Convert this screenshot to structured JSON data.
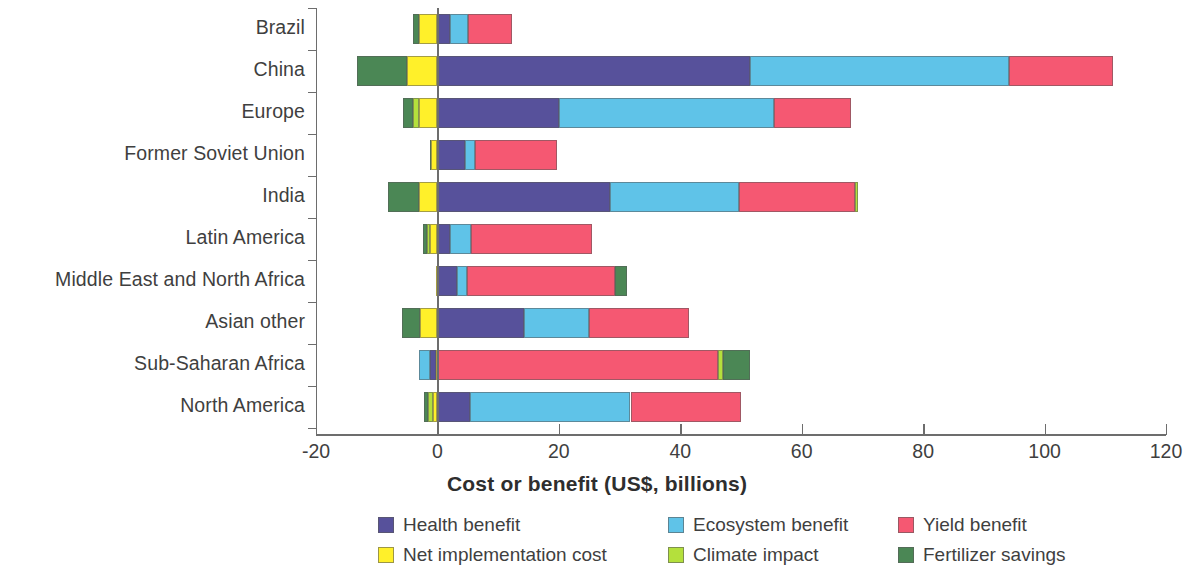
{
  "chart_data": {
    "type": "bar",
    "orientation": "horizontal",
    "stacked": true,
    "title": "",
    "xlabel": "Cost or benefit (US$, billions)",
    "ylabel": "",
    "xlim": [
      -20,
      120
    ],
    "xticks": [
      -20,
      0,
      20,
      40,
      60,
      80,
      100,
      120
    ],
    "xticklabels": [
      "-20",
      "0",
      "20",
      "40",
      "60",
      "80",
      "100",
      "120"
    ],
    "grid": false,
    "legend_position": "below",
    "categories": [
      "Brazil",
      "China",
      "Europe",
      "Former Soviet Union",
      "India",
      "Latin America",
      "Middle East and North Africa",
      "Asian other",
      "Sub-Saharan Africa",
      "North America"
    ],
    "series": [
      {
        "name": "Health benefit",
        "color": "#57519b",
        "values": [
          2.0,
          51.5,
          20.0,
          4.5,
          28.5,
          2.0,
          3.2,
          14.3,
          1.2,
          5.3
        ]
      },
      {
        "name": "Ecosystem benefit",
        "color": "#5fc3e8",
        "values": [
          3.0,
          42.7,
          35.5,
          1.7,
          21.2,
          3.6,
          1.7,
          10.7,
          -1.2,
          26.5
        ]
      },
      {
        "name": "Yield benefit",
        "color": "#f55872",
        "values": [
          7.3,
          17.0,
          12.7,
          13.5,
          19.0,
          19.8,
          24.3,
          16.5,
          46.2,
          18.2
        ]
      },
      {
        "name": "Net implementation cost",
        "color": "#fff02a",
        "values": [
          -3.1,
          -5.0,
          -3.1,
          -1.0,
          -3.1,
          -1.2,
          -0.3,
          -2.8,
          -0.3,
          -0.7
        ]
      },
      {
        "name": "Climate impact",
        "color": "#b4e03c",
        "values": [
          0.0,
          0.0,
          -1.0,
          0.0,
          0.5,
          -0.5,
          0.0,
          0.0,
          0.8,
          -0.8
        ]
      },
      {
        "name": "Fertilizer savings",
        "color": "#4b8755",
        "values": [
          -1.0,
          -8.2,
          -1.5,
          -0.3,
          -5.0,
          -0.7,
          2.0,
          -3.0,
          4.5,
          -0.7
        ]
      }
    ]
  },
  "legend": {
    "items": [
      {
        "label": "Health benefit",
        "color": "#57519b"
      },
      {
        "label": "Ecosystem benefit",
        "color": "#5fc3e8"
      },
      {
        "label": "Yield benefit",
        "color": "#f55872"
      },
      {
        "label": "Net implementation cost",
        "color": "#fff02a"
      },
      {
        "label": "Climate impact",
        "color": "#b4e03c"
      },
      {
        "label": "Fertilizer savings",
        "color": "#4b8755"
      }
    ]
  },
  "bars": [
    {
      "category": "Brazil",
      "segments": [
        {
          "series": "Fertilizer savings",
          "from": -4.1,
          "to": -3.1,
          "color": "#4b8755"
        },
        {
          "series": "Net implementation cost",
          "from": -3.1,
          "to": 0.0,
          "color": "#fff02a"
        },
        {
          "series": "Health benefit",
          "from": 0.0,
          "to": 2.0,
          "color": "#57519b"
        },
        {
          "series": "Ecosystem benefit",
          "from": 2.0,
          "to": 5.0,
          "color": "#5fc3e8"
        },
        {
          "series": "Yield benefit",
          "from": 5.0,
          "to": 12.3,
          "color": "#f55872"
        }
      ]
    },
    {
      "category": "China",
      "segments": [
        {
          "series": "Fertilizer savings",
          "from": -13.2,
          "to": -5.0,
          "color": "#4b8755"
        },
        {
          "series": "Net implementation cost",
          "from": -5.0,
          "to": 0.0,
          "color": "#fff02a"
        },
        {
          "series": "Health benefit",
          "from": 0.0,
          "to": 51.5,
          "color": "#57519b"
        },
        {
          "series": "Ecosystem benefit",
          "from": 51.5,
          "to": 94.2,
          "color": "#5fc3e8"
        },
        {
          "series": "Yield benefit",
          "from": 94.2,
          "to": 111.2,
          "color": "#f55872"
        }
      ]
    },
    {
      "category": "Europe",
      "segments": [
        {
          "series": "Fertilizer savings",
          "from": -5.6,
          "to": -4.1,
          "color": "#4b8755"
        },
        {
          "series": "Climate impact",
          "from": -4.1,
          "to": -3.1,
          "color": "#b4e03c"
        },
        {
          "series": "Net implementation cost",
          "from": -3.1,
          "to": 0.0,
          "color": "#fff02a"
        },
        {
          "series": "Health benefit",
          "from": 0.0,
          "to": 20.0,
          "color": "#57519b"
        },
        {
          "series": "Ecosystem benefit",
          "from": 20.0,
          "to": 55.5,
          "color": "#5fc3e8"
        },
        {
          "series": "Yield benefit",
          "from": 55.5,
          "to": 68.2,
          "color": "#f55872"
        }
      ]
    },
    {
      "category": "Former Soviet Union",
      "segments": [
        {
          "series": "Fertilizer savings",
          "from": -1.3,
          "to": -1.0,
          "color": "#4b8755"
        },
        {
          "series": "Net implementation cost",
          "from": -1.0,
          "to": 0.0,
          "color": "#fff02a"
        },
        {
          "series": "Health benefit",
          "from": 0.0,
          "to": 4.5,
          "color": "#57519b"
        },
        {
          "series": "Ecosystem benefit",
          "from": 4.5,
          "to": 6.2,
          "color": "#5fc3e8"
        },
        {
          "series": "Yield benefit",
          "from": 6.2,
          "to": 19.7,
          "color": "#f55872"
        }
      ]
    },
    {
      "category": "India",
      "segments": [
        {
          "series": "Fertilizer savings",
          "from": -8.1,
          "to": -3.1,
          "color": "#4b8755"
        },
        {
          "series": "Net implementation cost",
          "from": -3.1,
          "to": 0.0,
          "color": "#fff02a"
        },
        {
          "series": "Health benefit",
          "from": 0.0,
          "to": 28.5,
          "color": "#57519b"
        },
        {
          "series": "Ecosystem benefit",
          "from": 28.5,
          "to": 49.7,
          "color": "#5fc3e8"
        },
        {
          "series": "Yield benefit",
          "from": 49.7,
          "to": 68.7,
          "color": "#f55872"
        },
        {
          "series": "Climate impact",
          "from": 68.7,
          "to": 69.2,
          "color": "#b4e03c"
        }
      ]
    },
    {
      "category": "Latin America",
      "segments": [
        {
          "series": "Fertilizer savings",
          "from": -2.4,
          "to": -1.7,
          "color": "#4b8755"
        },
        {
          "series": "Climate impact",
          "from": -1.7,
          "to": -1.2,
          "color": "#b4e03c"
        },
        {
          "series": "Net implementation cost",
          "from": -1.2,
          "to": 0.0,
          "color": "#fff02a"
        },
        {
          "series": "Health benefit",
          "from": 0.0,
          "to": 2.0,
          "color": "#57519b"
        },
        {
          "series": "Ecosystem benefit",
          "from": 2.0,
          "to": 5.6,
          "color": "#5fc3e8"
        },
        {
          "series": "Yield benefit",
          "from": 5.6,
          "to": 25.4,
          "color": "#f55872"
        }
      ]
    },
    {
      "category": "Middle East and North Africa",
      "segments": [
        {
          "series": "Net implementation cost",
          "from": -0.3,
          "to": 0.0,
          "color": "#fff02a"
        },
        {
          "series": "Health benefit",
          "from": 0.0,
          "to": 3.2,
          "color": "#57519b"
        },
        {
          "series": "Ecosystem benefit",
          "from": 3.2,
          "to": 4.9,
          "color": "#5fc3e8"
        },
        {
          "series": "Yield benefit",
          "from": 4.9,
          "to": 29.2,
          "color": "#f55872"
        },
        {
          "series": "Fertilizer savings",
          "from": 29.2,
          "to": 31.2,
          "color": "#4b8755"
        }
      ]
    },
    {
      "category": "Asian other",
      "segments": [
        {
          "series": "Fertilizer savings",
          "from": -5.8,
          "to": -2.8,
          "color": "#4b8755"
        },
        {
          "series": "Net implementation cost",
          "from": -2.8,
          "to": 0.0,
          "color": "#fff02a"
        },
        {
          "series": "Health benefit",
          "from": 0.0,
          "to": 14.3,
          "color": "#57519b"
        },
        {
          "series": "Ecosystem benefit",
          "from": 14.3,
          "to": 25.0,
          "color": "#5fc3e8"
        },
        {
          "series": "Yield benefit",
          "from": 25.0,
          "to": 41.5,
          "color": "#f55872"
        }
      ]
    },
    {
      "category": "Sub-Saharan Africa",
      "segments": [
        {
          "series": "Ecosystem benefit",
          "from": -3.1,
          "to": -1.2,
          "color": "#5fc3e8"
        },
        {
          "series": "Health benefit",
          "from": -1.2,
          "to": -0.3,
          "color": "#57519b"
        },
        {
          "series": "Net implementation cost",
          "from": -0.3,
          "to": 0.0,
          "color": "#fff02a"
        },
        {
          "series": "Yield benefit",
          "from": 0.0,
          "to": 46.2,
          "color": "#f55872"
        },
        {
          "series": "Climate impact",
          "from": 46.2,
          "to": 47.0,
          "color": "#b4e03c"
        },
        {
          "series": "Fertilizer savings",
          "from": 47.0,
          "to": 51.5,
          "color": "#4b8755"
        }
      ]
    },
    {
      "category": "North America",
      "segments": [
        {
          "series": "Fertilizer savings",
          "from": -2.2,
          "to": -1.5,
          "color": "#4b8755"
        },
        {
          "series": "Climate impact",
          "from": -1.5,
          "to": -0.7,
          "color": "#b4e03c"
        },
        {
          "series": "Net implementation cost",
          "from": -0.7,
          "to": 0.0,
          "color": "#fff02a"
        },
        {
          "series": "Health benefit",
          "from": 0.0,
          "to": 5.3,
          "color": "#57519b"
        },
        {
          "series": "Ecosystem benefit",
          "from": 5.3,
          "to": 31.8,
          "color": "#5fc3e8"
        },
        {
          "series": "Yield benefit",
          "from": 31.8,
          "to": 50.0,
          "color": "#f55872"
        }
      ]
    }
  ],
  "axis": {
    "x_title": "Cost or benefit (US$, billions)"
  }
}
